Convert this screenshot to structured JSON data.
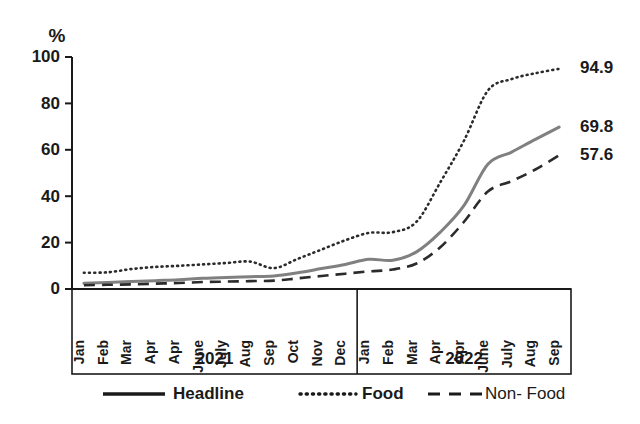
{
  "chart_data": {
    "type": "line",
    "title": "",
    "subtitle": "",
    "xlabel": "",
    "ylabel": "%",
    "ylim": [
      0,
      100
    ],
    "yticks": [
      0,
      20,
      40,
      60,
      80,
      100
    ],
    "grid": false,
    "legend_position": "bottom",
    "x": [
      "Jan",
      "Feb",
      "Mar",
      "Apr",
      "Apr",
      "June",
      "July",
      "Aug",
      "Sep",
      "Oct",
      "Nov",
      "Dec",
      "Jan",
      "Feb",
      "Mar",
      "Apr",
      "Apr",
      "June",
      "July",
      "Aug",
      "Sep"
    ],
    "x_groups": [
      {
        "label": "2021",
        "count": 12
      },
      {
        "label": "2022",
        "count": 9
      }
    ],
    "series": [
      {
        "name": "Headline",
        "style": "solid",
        "color": "#808080",
        "end_label": "69.8",
        "values": [
          2.5,
          2.8,
          3.2,
          3.6,
          4.0,
          4.6,
          5.0,
          5.3,
          5.6,
          7.0,
          8.8,
          10.6,
          12.8,
          12.4,
          16.0,
          24.5,
          36.0,
          53.8,
          59.0,
          64.5,
          69.8
        ]
      },
      {
        "name": "Food",
        "style": "dotted",
        "color": "#2b2b2b",
        "end_label": "94.9",
        "values": [
          7.0,
          7.2,
          8.6,
          9.5,
          10.0,
          10.6,
          11.2,
          11.8,
          9.0,
          13.0,
          17.0,
          21.0,
          24.2,
          24.5,
          29.0,
          46.0,
          64.0,
          85.5,
          90.5,
          93.0,
          94.9
        ]
      },
      {
        "name": "Non- Food",
        "style": "dashed",
        "color": "#2b2b2b",
        "end_label": "57.6",
        "values": [
          1.6,
          1.8,
          2.0,
          2.3,
          2.6,
          3.0,
          3.2,
          3.4,
          3.6,
          4.6,
          5.6,
          6.6,
          7.6,
          8.4,
          11.0,
          18.0,
          29.0,
          42.0,
          46.5,
          51.5,
          57.6
        ]
      }
    ]
  },
  "legend": {
    "items": [
      {
        "label": "Headline",
        "style": "solid",
        "weight": "bold"
      },
      {
        "label": "Food",
        "style": "dotted",
        "weight": "bold"
      },
      {
        "label": "Non- Food",
        "style": "dashed",
        "weight": "normal"
      }
    ]
  }
}
